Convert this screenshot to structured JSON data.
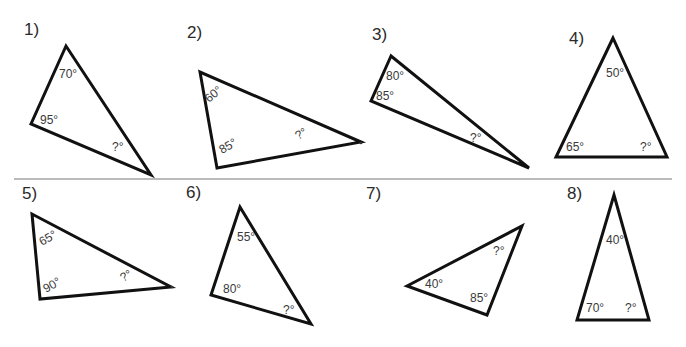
{
  "worksheet": {
    "problems": [
      {
        "number": "1)",
        "angles": [
          "70°",
          "95°",
          "?°"
        ]
      },
      {
        "number": "2)",
        "angles": [
          "60°",
          "85°",
          "?°"
        ]
      },
      {
        "number": "3)",
        "angles": [
          "80°",
          "85°",
          "?°"
        ]
      },
      {
        "number": "4)",
        "angles": [
          "50°",
          "65°",
          "?°"
        ]
      },
      {
        "number": "5)",
        "angles": [
          "65°",
          "90°",
          "?°"
        ]
      },
      {
        "number": "6)",
        "angles": [
          "55°",
          "80°",
          "?°"
        ]
      },
      {
        "number": "7)",
        "angles": [
          "40°",
          "85°",
          "?°"
        ]
      },
      {
        "number": "8)",
        "angles": [
          "40°",
          "70°",
          "?°"
        ]
      }
    ]
  }
}
